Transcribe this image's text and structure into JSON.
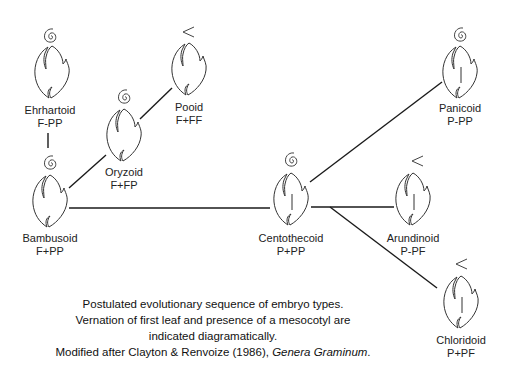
{
  "diagram": {
    "title": "Postulated evolutionary sequence of embryo types",
    "nodes": [
      {
        "id": "ehrhartoid",
        "name": "Ehrhartoid",
        "formula": "F-PP",
        "vernation": "rolled",
        "mesocotyl": false,
        "x": 50,
        "y": 71
      },
      {
        "id": "bambusoid",
        "name": "Bambusoid",
        "formula": "F+PP",
        "vernation": "rolled",
        "mesocotyl": false,
        "x": 50,
        "y": 200
      },
      {
        "id": "oryzoid",
        "name": "Oryzoid",
        "formula": "F+FP",
        "vernation": "rolled",
        "mesocotyl": false,
        "x": 125,
        "y": 134
      },
      {
        "id": "pooid",
        "name": "Pooid",
        "formula": "F+FF",
        "vernation": "folded",
        "mesocotyl": false,
        "x": 190,
        "y": 68
      },
      {
        "id": "centothecoid",
        "name": "Centothecoid",
        "formula": "P+PP",
        "vernation": "rolled",
        "mesocotyl": true,
        "x": 291,
        "y": 198
      },
      {
        "id": "arundinoid",
        "name": "Arundinoid",
        "formula": "P-PF",
        "vernation": "folded",
        "mesocotyl": true,
        "x": 413,
        "y": 198
      },
      {
        "id": "panicoid",
        "name": "Panicoid",
        "formula": "P-PP",
        "vernation": "rolled",
        "mesocotyl": true,
        "x": 460,
        "y": 71
      },
      {
        "id": "chloridoid",
        "name": "Chloridoid",
        "formula": "P+PF",
        "vernation": "folded",
        "mesocotyl": true,
        "x": 461,
        "y": 301
      }
    ],
    "edges": [
      {
        "from": "ehrhartoid",
        "to": "bambusoid"
      },
      {
        "from": "bambusoid",
        "to": "oryzoid"
      },
      {
        "from": "oryzoid",
        "to": "pooid"
      },
      {
        "from": "bambusoid",
        "to": "centothecoid"
      },
      {
        "from": "centothecoid",
        "to": "panicoid"
      },
      {
        "from": "centothecoid",
        "to": "arundinoid"
      },
      {
        "from": "centothecoid",
        "to": "chloridoid"
      }
    ],
    "icons": {
      "rolled": "spiral-icon",
      "folded": "chevron-left-icon"
    }
  },
  "caption": {
    "line1": "Postulated evolutionary sequence of embryo types.",
    "line2": "Vernation of first leaf and presence of a mesocotyl are",
    "line3": "indicated diagramatically.",
    "line4_prefix": "Modified after Clayton & Renvoize (1986), ",
    "line4_italic": "Genera Graminum",
    "line4_suffix": "."
  },
  "colors": {
    "line": "#1a1a1a",
    "glyph": "#333333",
    "background": "#ffffff"
  }
}
